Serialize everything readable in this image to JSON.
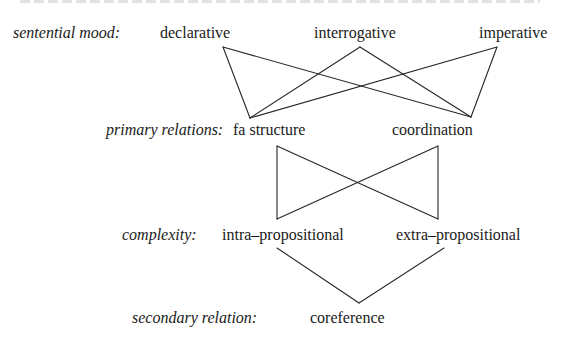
{
  "diagram": {
    "rows": [
      {
        "category": "sentential mood:",
        "nodes": [
          "declarative",
          "interrogative",
          "imperative"
        ]
      },
      {
        "category": "primary relations:",
        "nodes": [
          "fa structure",
          "coordination"
        ]
      },
      {
        "category": "complexity:",
        "nodes": [
          "intra–propositional",
          "extra–propositional"
        ]
      },
      {
        "category": "secondary relation:",
        "nodes": [
          "coreference"
        ]
      }
    ],
    "edges": [
      [
        "declarative",
        "fa structure"
      ],
      [
        "declarative",
        "coordination"
      ],
      [
        "interrogative",
        "fa structure"
      ],
      [
        "interrogative",
        "coordination"
      ],
      [
        "imperative",
        "fa structure"
      ],
      [
        "imperative",
        "coordination"
      ],
      [
        "fa structure",
        "intra–propositional"
      ],
      [
        "fa structure",
        "extra–propositional"
      ],
      [
        "coordination",
        "intra–propositional"
      ],
      [
        "coordination",
        "extra–propositional"
      ],
      [
        "intra–propositional",
        "coreference"
      ],
      [
        "extra–propositional",
        "coreference"
      ]
    ],
    "line_color": "#262626"
  }
}
